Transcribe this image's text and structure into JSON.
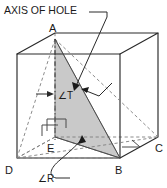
{
  "figure": {
    "background_color": "#ffffff",
    "line_color": "#2a2a2a",
    "hidden_line_color": "#7a7a7a",
    "shade_color": "#c9c9c9",
    "shade_edge_color": "#8f8f8f",
    "text_color": "#1a1a1a"
  },
  "labels": {
    "axis_of_hole": "AXIS OF HOLE",
    "angle_t": "∠T",
    "angle_r": "∠R",
    "vertex_a": "A",
    "vertex_b": "B",
    "vertex_c": "C",
    "vertex_d": "D",
    "vertex_e": "E"
  },
  "geometry": {
    "cube_front_top_left": [
      17,
      54
    ],
    "cube_front_top_right": [
      120,
      54
    ],
    "cube_front_bottom_left": [
      17,
      158
    ],
    "cube_front_bottom_right": [
      120,
      158
    ],
    "cube_back_top_left": [
      55,
      33
    ],
    "cube_back_top_right": [
      158,
      33
    ],
    "cube_back_bottom_left": [
      55,
      137
    ],
    "cube_back_bottom_right": [
      158,
      137
    ],
    "point_a": [
      55,
      39
    ],
    "point_b": [
      120,
      158
    ],
    "point_c": [
      158,
      137
    ],
    "point_d": [
      17,
      158
    ],
    "point_e": [
      55,
      137
    ],
    "shaded_triangle": [
      [
        55,
        39
      ],
      [
        120,
        158
      ],
      [
        55,
        137
      ]
    ],
    "axis_line": [
      [
        55,
        39
      ],
      [
        55,
        137
      ]
    ]
  },
  "annotations": {
    "axis_leader_from": [
      108,
      16
    ],
    "axis_leader_to": [
      78,
      88
    ],
    "angle_t_arrow_from": [
      38,
      94
    ],
    "angle_t_arrow_to": [
      52,
      94
    ],
    "angle_r_leader_from": [
      70,
      176
    ],
    "angle_r_leader_to": [
      82,
      138
    ],
    "right_angle_marker_e": [
      58,
      122
    ],
    "right_angle_marker_c": [
      126,
      143
    ]
  }
}
